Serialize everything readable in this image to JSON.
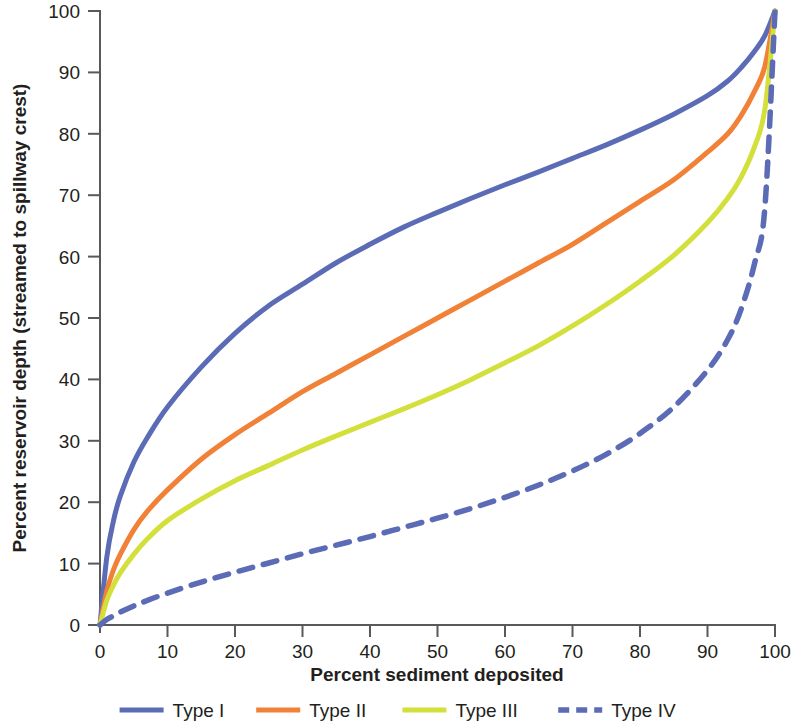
{
  "chart_data": {
    "type": "line",
    "title": "",
    "xlabel": "Percent sediment deposited",
    "ylabel": "Percent reservoir depth (streamed to spillway crest)",
    "xlim": [
      0,
      100
    ],
    "ylim": [
      0,
      100
    ],
    "xticks": [
      "0",
      "10",
      "20",
      "30",
      "40",
      "50",
      "60",
      "70",
      "80",
      "90",
      "100"
    ],
    "yticks": [
      "0",
      "10",
      "20",
      "30",
      "40",
      "50",
      "60",
      "70",
      "80",
      "90",
      "100"
    ],
    "grid": false,
    "legend_position": "bottom",
    "x": [
      0,
      1,
      2,
      3,
      5,
      7,
      10,
      15,
      20,
      25,
      30,
      35,
      40,
      45,
      50,
      55,
      60,
      65,
      70,
      75,
      80,
      85,
      90,
      93,
      95,
      97,
      98.5,
      100
    ],
    "series": [
      {
        "name": "Type I",
        "color": "#5b6bb5",
        "style": "solid",
        "values": [
          0,
          11,
          17,
          21,
          26.5,
          30.5,
          35.5,
          42,
          47.5,
          52,
          55.5,
          59,
          62,
          64.8,
          67.2,
          69.5,
          71.7,
          73.8,
          76,
          78.2,
          80.6,
          83.2,
          86.2,
          88.6,
          90.8,
          93.5,
          96,
          100
        ]
      },
      {
        "name": "Type II",
        "color": "#f08137",
        "style": "solid",
        "values": [
          0,
          5.5,
          9,
          11.5,
          15.5,
          18.5,
          22,
          27,
          31,
          34.5,
          38,
          41,
          44,
          47,
          50,
          53,
          56,
          59,
          62,
          65.5,
          69,
          72.5,
          77,
          80,
          83,
          87,
          91,
          100
        ]
      },
      {
        "name": "Type III",
        "color": "#d3e03c",
        "style": "solid",
        "values": [
          0,
          4,
          6.5,
          8.5,
          11.5,
          14,
          17,
          20.5,
          23.5,
          26,
          28.5,
          30.8,
          33,
          35.2,
          37.5,
          40,
          42.7,
          45.5,
          48.7,
          52.2,
          56,
          60.2,
          65.5,
          69.5,
          73,
          78,
          84,
          100
        ]
      },
      {
        "name": "Type IV",
        "color": "#5b6bb5",
        "style": "dashed",
        "values": [
          0,
          0.9,
          1.5,
          2.1,
          3.1,
          4.0,
          5.2,
          7.0,
          8.6,
          10.1,
          11.6,
          13.0,
          14.4,
          15.9,
          17.4,
          19.0,
          20.8,
          22.8,
          25.1,
          27.8,
          31.2,
          35.5,
          41.5,
          46.5,
          51.5,
          59,
          68,
          100
        ]
      }
    ]
  },
  "legend": {
    "items": [
      {
        "label": "Type I"
      },
      {
        "label": "Type II"
      },
      {
        "label": "Type III"
      },
      {
        "label": "Type IV"
      }
    ]
  }
}
